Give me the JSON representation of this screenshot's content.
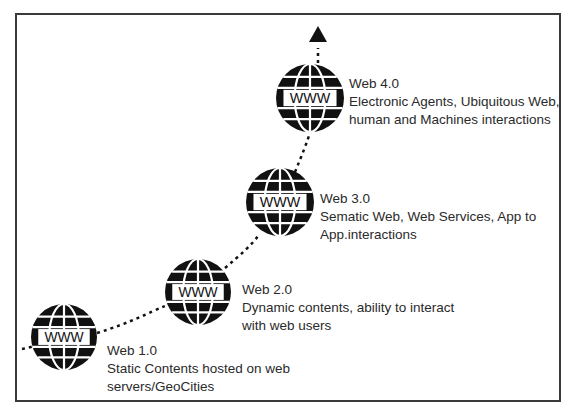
{
  "diagram": {
    "globe_text": "WWW",
    "stages": [
      {
        "name": "Web 1.0",
        "description": "Static Contents hosted on web servers/GeoCities",
        "lines": [
          "Static Contents hosted on web",
          "servers/GeoCities"
        ]
      },
      {
        "name": "Web 2.0",
        "description": "Dynamic contents, ability to interact with web users",
        "lines": [
          "Dynamic contents, ability to interact",
          "with web users"
        ]
      },
      {
        "name": "Web 3.0",
        "description": "Sematic Web, Web Services, App to App.interactions",
        "lines": [
          "Sematic Web, Web Services, App to",
          "App.interactions"
        ]
      },
      {
        "name": "Web 4.0",
        "description": "Electronic Agents, Ubiquitous Web, human and Machines interactions",
        "lines": [
          "Electronic Agents, Ubiquitous Web,",
          "human and Machines interactions"
        ]
      }
    ],
    "colors": {
      "ink": "#111111",
      "frame": "#3a3a3a",
      "text": "#2a2a2a"
    }
  }
}
